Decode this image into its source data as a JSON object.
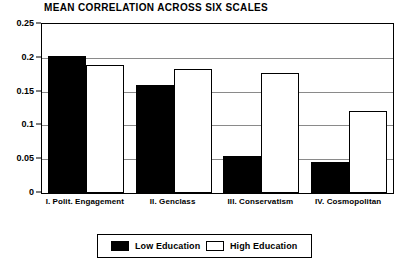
{
  "chart_data": {
    "type": "bar",
    "title": "MEAN CORRELATION ACROSS SIX SCALES",
    "xlabel": "",
    "ylabel": "",
    "ylim": [
      0,
      0.25
    ],
    "yticks": [
      0,
      0.05,
      0.1,
      0.15,
      0.2,
      0.25
    ],
    "ytick_labels": [
      "0",
      "0.05",
      "0.1",
      "0.15",
      "0.2",
      "0.25"
    ],
    "grid": true,
    "legend_position": "bottom-center",
    "categories": [
      "I. Polit. Engagement",
      "II. Genclass",
      "III. Conservatism",
      "IV. Cosmopolitan"
    ],
    "series": [
      {
        "name": "Low Education",
        "color": "#000000",
        "values": [
          0.203,
          0.16,
          0.055,
          0.046
        ]
      },
      {
        "name": "High Education",
        "color": "#ffffff",
        "values": [
          0.189,
          0.184,
          0.177,
          0.121
        ]
      }
    ]
  },
  "legend": {
    "entries": [
      {
        "label": "Low Education",
        "swatch": "black-filled-swatch"
      },
      {
        "label": "High Education",
        "swatch": "white-outlined-swatch"
      }
    ]
  }
}
